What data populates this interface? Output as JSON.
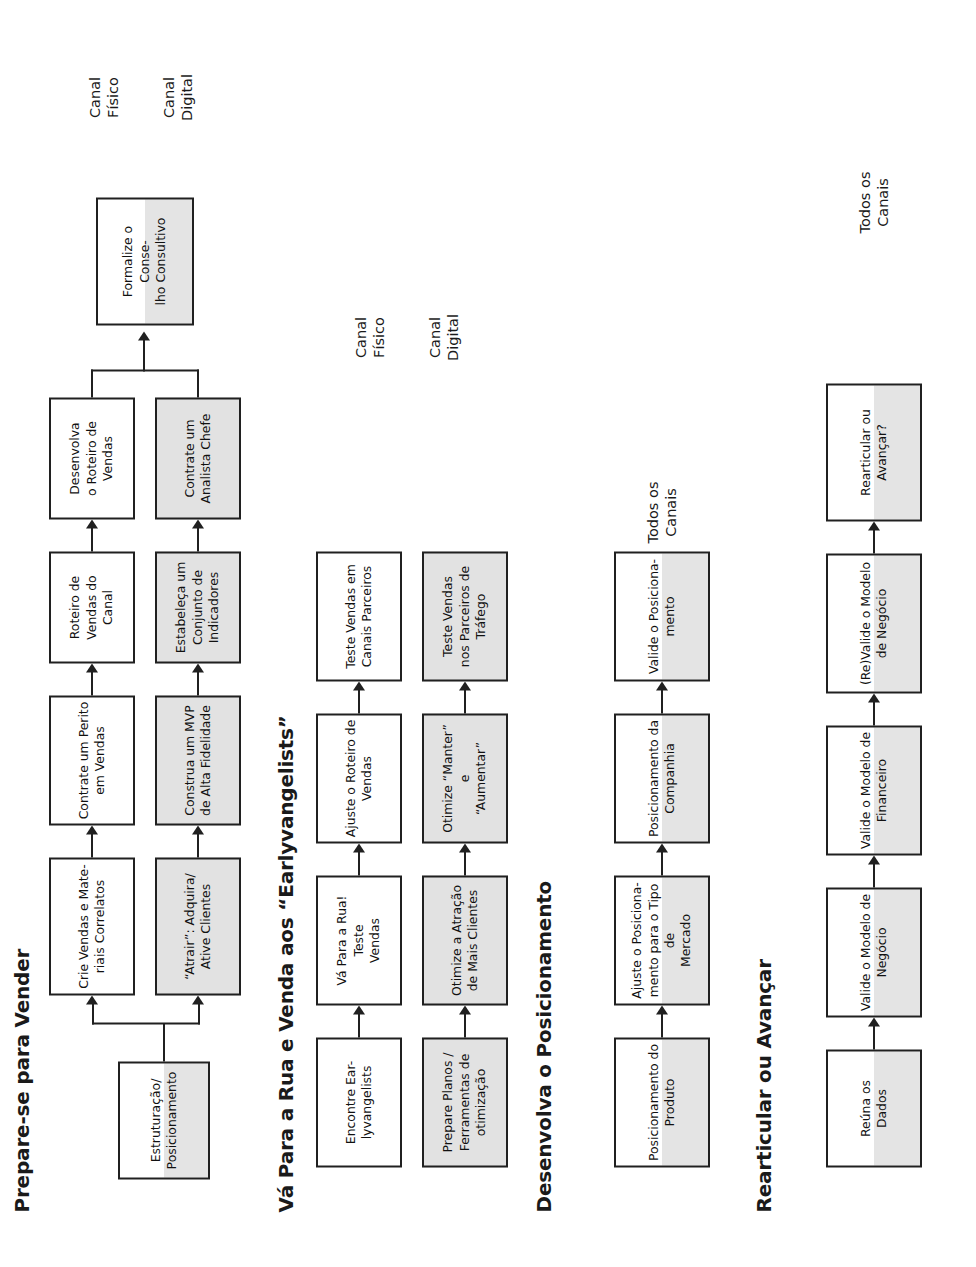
{
  "document": {
    "title": "Mapa de Processos de Desenvolvimento de Clientes",
    "colors": {
      "box_fill_physical": "#ffffff",
      "box_fill_digital": "#e2e2e2",
      "box_border": "#202020",
      "text": "#111111"
    }
  },
  "sections": [
    {
      "id": "prepare-se-para-vender",
      "title": "Prepare-se para Vender",
      "band_labels": [
        {
          "id": "canal-fisico",
          "text": "Canal\nFísico"
        },
        {
          "id": "canal-digital",
          "text": "Canal\nDigital"
        }
      ],
      "boxes": {
        "start": "Estruturação/\nPosicionamento",
        "physical": [
          "Crie Vendas e Mate-\nriais Correlatos",
          "Contrate um Perito\nem Vendas",
          "Roteiro de\nVendas do\nCanal",
          "Desenvolva\no Roteiro de\nVendas"
        ],
        "digital": [
          "“Atrair”: Adquira/\nAtive Clientes",
          "Construa um MVP\nde Alta Fidelidade",
          "Estabeleça um\nConjunto de\nIndicadores",
          "Contrate um\nAnalista Chefe"
        ],
        "end": "Formalize o Conse-\nlho Consultivo"
      }
    },
    {
      "id": "va-para-a-rua",
      "title": "Vá Para a Rua e Venda aos “Earlyvangelists”",
      "band_labels": [
        {
          "id": "canal-fisico",
          "text": "Canal\nFísico"
        },
        {
          "id": "canal-digital",
          "text": "Canal\nDigital"
        }
      ],
      "boxes": {
        "physical": [
          "Encontre Ear-\nlyvangelists",
          "Vá Para a Rua! Teste\nVendas",
          "Ajuste o Roteiro de\nVendas",
          "Teste Vendas em\nCanais Parceiros"
        ],
        "digital": [
          "Prepare Planos /\nFerramentas de\notimização",
          "Otimize a Atração\nde Mais Clientes",
          "Otimize “Manter” e\n“Aumentar”",
          "Teste Vendas\nnos Parceiros de\nTráfego"
        ]
      }
    },
    {
      "id": "desenvolva-o-posicionamento",
      "title": "Desenvolva o Posicionamento",
      "band_labels": [
        {
          "id": "todos-os-canais",
          "text": "Todos os\nCanais"
        }
      ],
      "boxes": {
        "all_channels": [
          "Posicionamento do\nProduto",
          "Ajuste o Posiciona-\nmento para o Tipo de\nMercado",
          "Posicionamento da\nCompanhia",
          "Valide o Posiciona-\nmento"
        ]
      }
    },
    {
      "id": "rearticular-ou-avancar",
      "title": "Rearticular ou Avançar",
      "band_labels": [
        {
          "id": "todos-os-canais",
          "text": "Todos os\nCanais"
        }
      ],
      "boxes": {
        "all_channels": [
          "Reúna os\nDados",
          "Valide o Modelo de\nNegócio",
          "Valide o Modelo de\nFinanceiro",
          "(Re)Valide o Modelo\nde Negócio",
          "Rearticular ou\nAvançar?"
        ]
      }
    }
  ]
}
